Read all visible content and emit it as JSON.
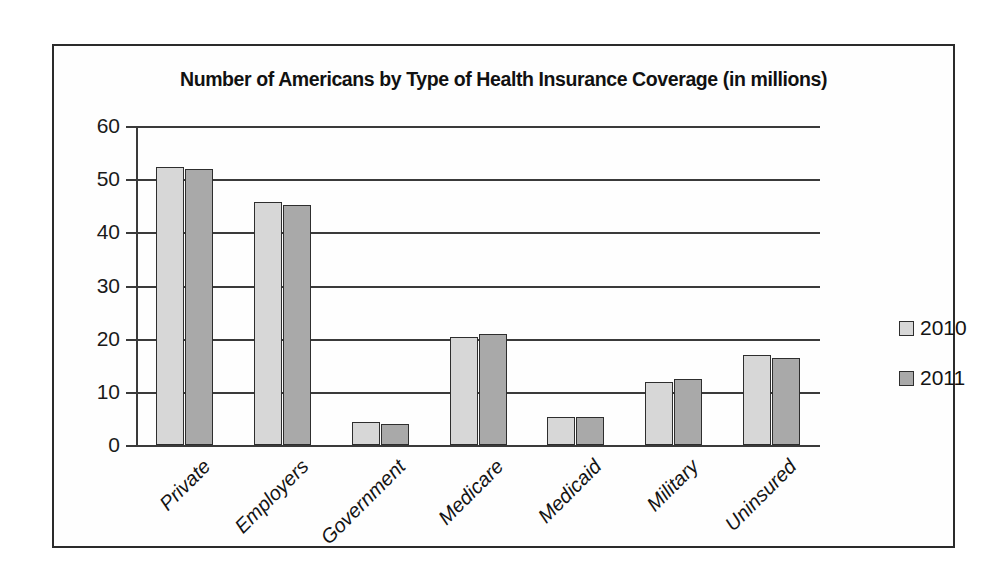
{
  "chart_data": {
    "type": "bar",
    "title": "Number of Americans by Type of Health Insurance Coverage (in millions)",
    "xlabel": "",
    "ylabel": "",
    "ylim": [
      0,
      60
    ],
    "yticks": [
      0,
      10,
      20,
      30,
      40,
      50,
      60
    ],
    "ytick_labels": [
      "0",
      "10",
      "20",
      "30",
      "40",
      "50",
      "60"
    ],
    "grid": true,
    "legend_position": "right",
    "categories": [
      "Private",
      "Employers",
      "Government",
      "Medicare",
      "Medicaid",
      "Military",
      "Uninsured"
    ],
    "series": [
      {
        "name": "2010",
        "color": "#d7d7d7",
        "values": [
          52.3,
          45.7,
          4.3,
          20.4,
          5.3,
          11.9,
          16.9
        ]
      },
      {
        "name": "2011",
        "color": "#a9a9a9",
        "values": [
          52.0,
          45.2,
          4.0,
          20.9,
          5.3,
          12.4,
          16.4
        ]
      }
    ]
  },
  "colors": {
    "series_2010": "#d7d7d7",
    "series_2011": "#a9a9a9",
    "axis": "#3a3a3a",
    "frame": "#2b2b2b",
    "text": "#141414",
    "background": "#ffffff"
  }
}
